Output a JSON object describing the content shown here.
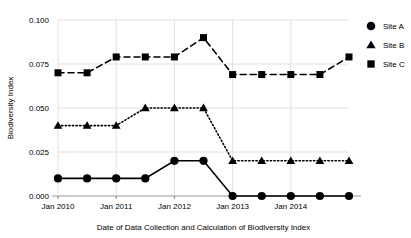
{
  "chart_data": {
    "type": "line",
    "title": "",
    "xlabel": "Date of Data Collection and Calculation of Biodiversity Index",
    "ylabel": "Biodiversity Index",
    "ylim": [
      0.0,
      0.1
    ],
    "ytick_labels": [
      "0.000",
      "0.025",
      "0.050",
      "0.075",
      "0.100"
    ],
    "ytick_values": [
      0.0,
      0.025,
      0.05,
      0.075,
      0.1
    ],
    "xtick_labels": [
      "Jan 2010",
      "Jan 2011",
      "Jan 2012",
      "Jan 2013",
      "Jan 2014"
    ],
    "xtick_values": [
      0,
      2,
      4,
      6,
      8
    ],
    "x": [
      0,
      1,
      2,
      3,
      4,
      5,
      6,
      7,
      8,
      9,
      10
    ],
    "grid": "vertical gridlines at year ticks, horizontal gridlines at y ticks",
    "legend_position": "right",
    "series": [
      {
        "name": "Site A",
        "marker": "circle",
        "linestyle": "solid",
        "color": "#000000",
        "values": [
          0.01,
          0.01,
          0.01,
          0.01,
          0.02,
          0.02,
          0.0,
          0.0,
          0.0,
          0.0,
          0.0
        ]
      },
      {
        "name": "Site B",
        "marker": "triangle",
        "linestyle": "dotted",
        "color": "#000000",
        "values": [
          0.04,
          0.04,
          0.04,
          0.05,
          0.05,
          0.05,
          0.02,
          0.02,
          0.02,
          0.02,
          0.02
        ]
      },
      {
        "name": "Site C",
        "marker": "square",
        "linestyle": "dashed",
        "color": "#000000",
        "values": [
          0.07,
          0.07,
          0.079,
          0.079,
          0.079,
          0.09,
          0.069,
          0.069,
          0.069,
          0.069,
          0.079
        ]
      }
    ]
  },
  "legend": {
    "items": [
      {
        "label": "Site A",
        "marker": "circle-marker-icon"
      },
      {
        "label": "Site B",
        "marker": "triangle-marker-icon"
      },
      {
        "label": "Site C",
        "marker": "square-marker-icon"
      }
    ]
  }
}
